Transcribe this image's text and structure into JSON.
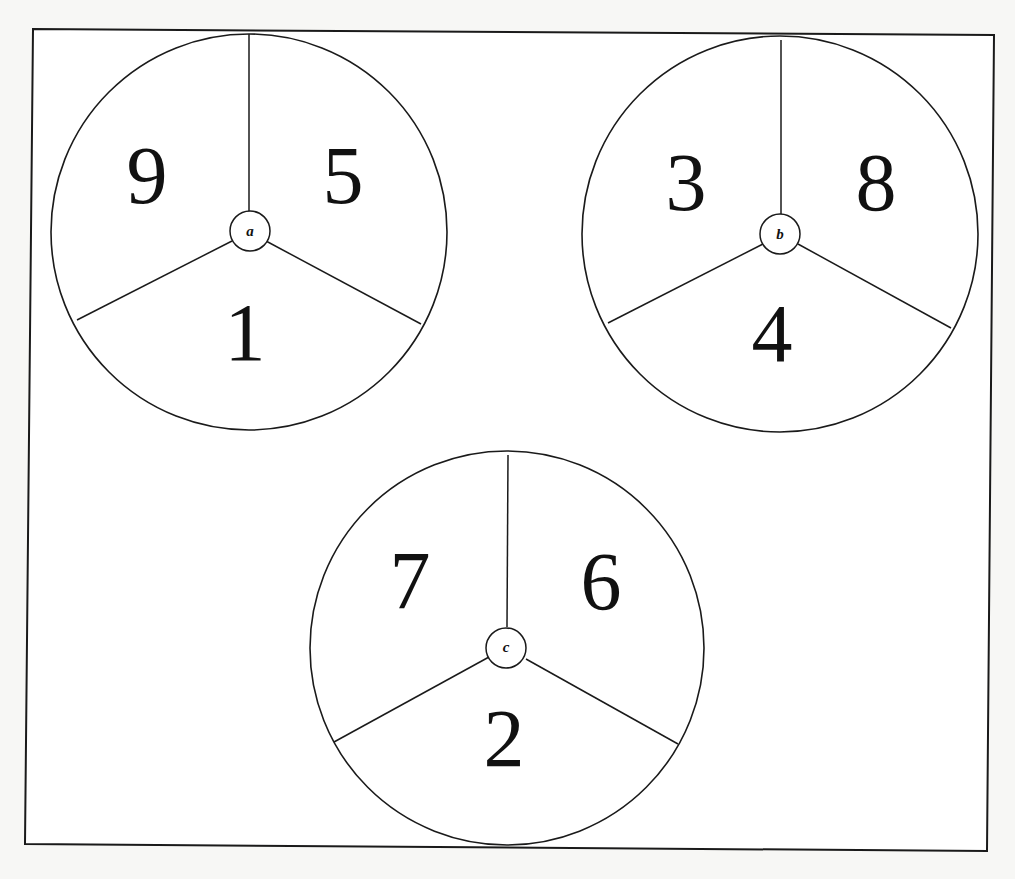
{
  "figure": {
    "spinners": [
      {
        "label": "a",
        "numbers": {
          "top_left": "9",
          "top_right": "5",
          "bottom": "1"
        }
      },
      {
        "label": "b",
        "numbers": {
          "top_left": "3",
          "top_right": "8",
          "bottom": "4"
        }
      },
      {
        "label": "c",
        "numbers": {
          "top_left": "7",
          "top_right": "6",
          "bottom": "2"
        }
      }
    ]
  },
  "colors": {
    "line": "#1a1a1a",
    "fill": "#ffffff",
    "text": "#111111"
  }
}
